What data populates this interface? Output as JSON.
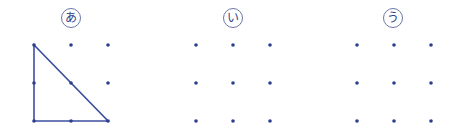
{
  "figures": [
    {
      "label": "あ",
      "origin_x": 34,
      "shape": "right-triangle",
      "triangle": [
        [
          0,
          0
        ],
        [
          0,
          2
        ],
        [
          2,
          2
        ]
      ]
    },
    {
      "label": "い",
      "origin_x": 196,
      "shape": "none"
    },
    {
      "label": "う",
      "origin_x": 357,
      "shape": "none"
    }
  ],
  "grid": {
    "rows": 3,
    "cols": 3,
    "spacing_x": 37,
    "spacing_y": 38,
    "origin_y": 45
  },
  "colors": {
    "dot": "#2b3f8f",
    "line": "#3d4fa0",
    "label": "#2f3f8a"
  }
}
